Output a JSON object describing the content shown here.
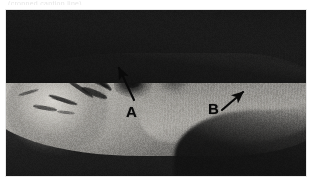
{
  "figure": {
    "kind": "grayscale-medical-photograph",
    "caption_remnant": "(cropped caption line)",
    "plate": {
      "x": 6,
      "y": 10,
      "width": 300,
      "height": 166,
      "border_color": "#e9e9e9",
      "background_color": "#1c1c1c"
    },
    "palette": {
      "background": "#ffffff",
      "field_dark": "#232323",
      "shadow_dark": "#141414",
      "tissue_mid": "#96948f",
      "tissue_light": "#d6d4cf",
      "annotation_ink": "#0a0a0a"
    },
    "annotations": [
      {
        "id": "a",
        "label": "A",
        "label_x": 126,
        "label_y": 104,
        "arrow_tail_x": 134,
        "arrow_tail_y": 100,
        "arrow_tip_x": 119,
        "arrow_tip_y": 68,
        "description": "arrow pointing up and to the left toward a dark irregular defect"
      },
      {
        "id": "b",
        "label": "B",
        "label_x": 208,
        "label_y": 101,
        "arrow_tail_x": 222,
        "arrow_tail_y": 110,
        "arrow_tip_x": 243,
        "arrow_tip_y": 92,
        "description": "arrow pointing up and to the right toward the pale tissue flank"
      }
    ]
  }
}
